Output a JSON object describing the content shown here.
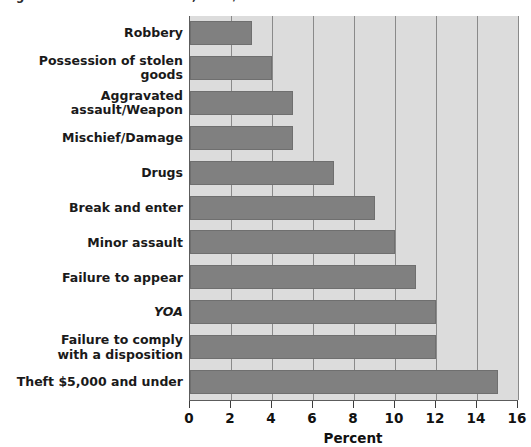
{
  "figure": {
    "title_fragment": "Figure 3.4  Youth court cases, 2003/04"
  },
  "chart_data": {
    "type": "bar",
    "orientation": "horizontal",
    "title": "",
    "xlabel": "Percent",
    "ylabel": "",
    "xlim": [
      0,
      16
    ],
    "xticks": [
      0,
      2,
      4,
      6,
      8,
      10,
      12,
      14,
      16
    ],
    "xtick_labels": [
      "0",
      "2",
      "4",
      "6",
      "8",
      "10",
      "12",
      "14",
      "16"
    ],
    "grid": "vertical",
    "legend": "none",
    "bar_color": "#808080",
    "plot_background": "#dcdcdc",
    "gridline_color": "#8a8a8a",
    "axis_color": "#5c5c5c",
    "categories": [
      "Robbery",
      "Possession of stolen goods",
      "Aggravated assault/Weapon",
      "Mischief/Damage",
      "Drugs",
      "Break and enter",
      "Minor assault",
      "Failure to appear",
      "YOA",
      "Failure to comply\nwith a disposition",
      "Theft $5,000 and under"
    ],
    "category_lines": [
      [
        "Robbery"
      ],
      [
        "Possession of stolen goods"
      ],
      [
        "Aggravated assault/Weapon"
      ],
      [
        "Mischief/Damage"
      ],
      [
        "Drugs"
      ],
      [
        "Break and enter"
      ],
      [
        "Minor assault"
      ],
      [
        "Failure to appear"
      ],
      [
        "YOA"
      ],
      [
        "Failure to comply",
        "with a disposition"
      ],
      [
        "Theft $5,000 and under"
      ]
    ],
    "italic_categories": [
      "YOA"
    ],
    "values": [
      3.0,
      4.0,
      5.0,
      5.0,
      7.0,
      9.0,
      10.0,
      11.0,
      12.0,
      12.0,
      15.0
    ]
  }
}
